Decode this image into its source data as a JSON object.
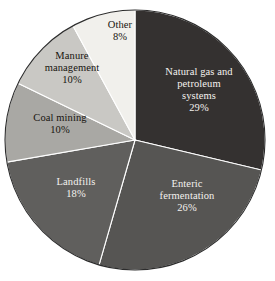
{
  "chart_data": {
    "type": "pie",
    "title": "",
    "subtitle": "",
    "xlabel": "",
    "ylabel": "",
    "legend_position": "none",
    "grid": false,
    "labels_inside_slices": true,
    "start_angle_deg": 0,
    "direction": "clockwise",
    "categories": [
      "Natural gas and petroleum systems",
      "Enteric fermentation",
      "Landfills",
      "Coal mining",
      "Manure management",
      "Other"
    ],
    "values": [
      29,
      26,
      18,
      10,
      10,
      8
    ],
    "value_unit": "%",
    "slices": [
      {
        "name": "Natural gas and petroleum systems",
        "label_lines": [
          "Natural gas and",
          "petroleum",
          "systems"
        ],
        "value": 29,
        "value_text": "29%",
        "color": "#343130",
        "text_color": "#f4f2ef"
      },
      {
        "name": "Enteric fermentation",
        "label_lines": [
          "Enteric",
          "fermentation"
        ],
        "value": 26,
        "value_text": "26%",
        "color": "#565553",
        "text_color": "#f4f2ef"
      },
      {
        "name": "Landfills",
        "label_lines": [
          "Landfills"
        ],
        "value": 18,
        "value_text": "18%",
        "color": "#605f5d",
        "text_color": "#f4f2ef"
      },
      {
        "name": "Coal mining",
        "label_lines": [
          "Coal mining"
        ],
        "value": 10,
        "value_text": "10%",
        "color": "#a9a8a4",
        "text_color": "#17140f"
      },
      {
        "name": "Manure management",
        "label_lines": [
          "Manure",
          "management"
        ],
        "value": 10,
        "value_text": "10%",
        "color": "#c9c8c4",
        "text_color": "#17140f"
      },
      {
        "name": "Other",
        "label_lines": [
          "Other"
        ],
        "value": 8,
        "value_text": "8%",
        "color": "#f1f0ec",
        "text_color": "#17140f"
      }
    ],
    "geometry": {
      "center_x": 135,
      "center_y": 140,
      "radius": 130
    },
    "colors": {
      "background": "#ffffff",
      "outline": "#2c2c2c",
      "separator": "#ffffff"
    }
  }
}
